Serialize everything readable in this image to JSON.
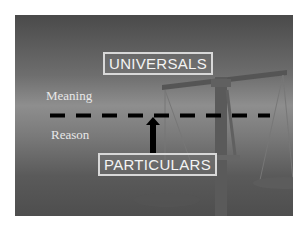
{
  "diagram": {
    "top_box": "UNIVERSALS",
    "bottom_box": "PARTICULARS",
    "upper_region_label": "Meaning",
    "lower_region_label": "Reason",
    "divider": "dashed-line",
    "arrow": {
      "from": "PARTICULARS",
      "to": "divider",
      "direction": "up"
    },
    "background_image": "balance-scale-icon"
  },
  "colors": {
    "background": "#ffffff",
    "panel_dark": "#4a4a4a",
    "panel_light": "#8e8e8e",
    "text": "#f4f4f4",
    "dash": "#000000"
  }
}
